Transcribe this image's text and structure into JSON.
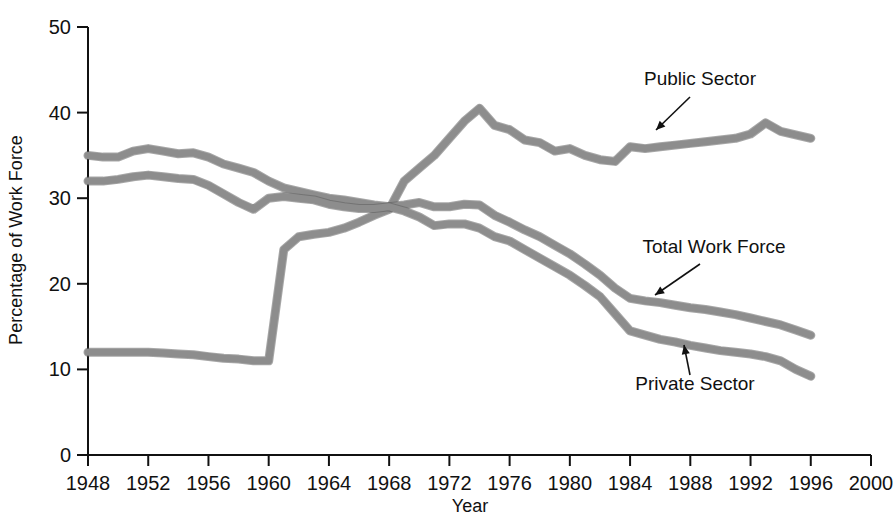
{
  "chart_data": {
    "type": "line",
    "title": "",
    "xlabel": "Year",
    "ylabel": "Percentage of Work Force",
    "xlim": [
      1948,
      2000
    ],
    "ylim": [
      0,
      50
    ],
    "grid": false,
    "legend_position": "inline-annotations",
    "xticks": [
      1948,
      1952,
      1956,
      1960,
      1964,
      1968,
      1972,
      1976,
      1980,
      1984,
      1988,
      1992,
      1996,
      2000
    ],
    "yticks": [
      0,
      10,
      20,
      30,
      40,
      50
    ],
    "x": [
      1948,
      1949,
      1950,
      1951,
      1952,
      1953,
      1954,
      1955,
      1956,
      1957,
      1958,
      1959,
      1960,
      1961,
      1962,
      1963,
      1964,
      1965,
      1966,
      1967,
      1968,
      1969,
      1970,
      1971,
      1972,
      1973,
      1974,
      1975,
      1976,
      1977,
      1978,
      1979,
      1980,
      1981,
      1982,
      1983,
      1984,
      1985,
      1986,
      1987,
      1988,
      1989,
      1990,
      1991,
      1992,
      1993,
      1994,
      1995,
      1996
    ],
    "series": [
      {
        "name": "Public Sector",
        "values": [
          12.0,
          12.0,
          12.0,
          12.0,
          12.0,
          11.9,
          11.8,
          11.7,
          11.5,
          11.3,
          11.2,
          11.0,
          11.0,
          24.0,
          25.5,
          25.8,
          26.0,
          26.5,
          27.2,
          28.0,
          28.7,
          32.0,
          33.5,
          35.0,
          37.0,
          39.0,
          40.5,
          38.5,
          38.0,
          36.8,
          36.5,
          35.5,
          35.8,
          35.0,
          34.5,
          34.3,
          36.0,
          35.8,
          36.0,
          36.2,
          36.4,
          36.6,
          36.8,
          37.0,
          37.5,
          38.8,
          37.8,
          37.4,
          37.0
        ]
      },
      {
        "name": "Total Work Force",
        "values": [
          35.0,
          34.8,
          34.8,
          35.5,
          35.8,
          35.5,
          35.2,
          35.3,
          34.8,
          34.0,
          33.5,
          33.0,
          32.0,
          31.2,
          30.8,
          30.4,
          30.0,
          29.8,
          29.5,
          29.2,
          29.0,
          29.2,
          29.5,
          29.0,
          29.0,
          29.3,
          29.2,
          28.0,
          27.2,
          26.3,
          25.5,
          24.5,
          23.5,
          22.3,
          21.0,
          19.5,
          18.3,
          18.0,
          17.8,
          17.5,
          17.2,
          17.0,
          16.7,
          16.4,
          16.0,
          15.6,
          15.2,
          14.6,
          14.0
        ]
      },
      {
        "name": "Private Sector",
        "values": [
          32.0,
          32.0,
          32.2,
          32.5,
          32.7,
          32.5,
          32.3,
          32.2,
          31.5,
          30.5,
          29.5,
          28.7,
          30.0,
          30.2,
          30.0,
          29.8,
          29.3,
          29.0,
          28.8,
          28.8,
          29.0,
          28.5,
          27.8,
          26.8,
          27.0,
          27.0,
          26.5,
          25.5,
          25.0,
          24.0,
          23.0,
          22.0,
          21.0,
          19.8,
          18.5,
          16.5,
          14.5,
          14.0,
          13.5,
          13.2,
          12.8,
          12.5,
          12.2,
          12.0,
          11.8,
          11.5,
          11.0,
          10.0,
          9.2
        ]
      }
    ],
    "annotations": [
      {
        "text": "Public Sector",
        "label_x": 700,
        "label_y": 85,
        "arrow_from_x": 690,
        "arrow_from_y": 97,
        "arrow_to_x": 656,
        "arrow_to_y": 130
      },
      {
        "text": "Total Work Force",
        "label_x": 714,
        "label_y": 253,
        "arrow_from_x": 700,
        "arrow_from_y": 264,
        "arrow_to_x": 655,
        "arrow_to_y": 295
      },
      {
        "text": "Private Sector",
        "label_x": 695,
        "label_y": 390,
        "arrow_from_x": 690,
        "arrow_from_y": 375,
        "arrow_to_x": 684,
        "arrow_to_y": 345
      }
    ],
    "line_color": "#8d8d8d",
    "axis_color": "#111111"
  }
}
